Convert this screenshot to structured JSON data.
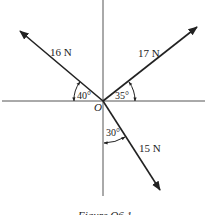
{
  "figure": {
    "origin_label": "O",
    "caption": "Figure Q6.1",
    "forces": [
      {
        "id": "f16",
        "label": "16 N",
        "angle_label": "40°",
        "reference": "negative x-axis",
        "direction_deg_from_pos_x": 140
      },
      {
        "id": "f17",
        "label": "17 N",
        "angle_label": "35°",
        "reference": "positive x-axis",
        "direction_deg_from_pos_x": 35
      },
      {
        "id": "f15",
        "label": "15 N",
        "angle_label": "30°",
        "reference": "negative y-axis",
        "direction_deg_from_pos_x": -60
      }
    ],
    "colors": {
      "line": "#222222",
      "axis": "#555555",
      "background": "#ffffff"
    }
  }
}
